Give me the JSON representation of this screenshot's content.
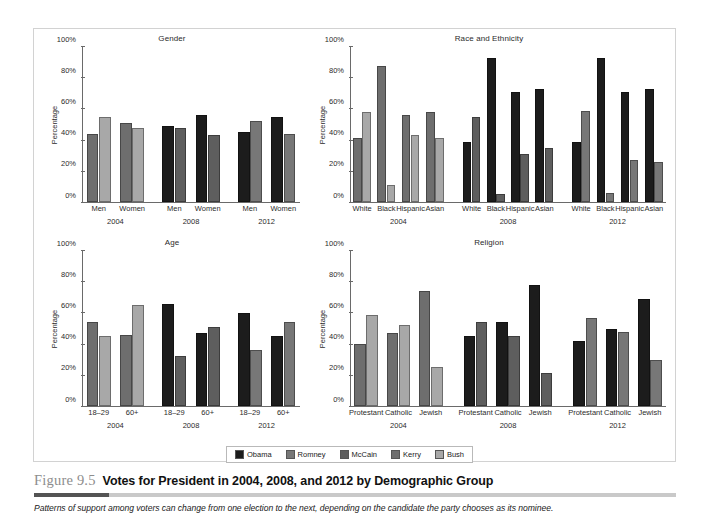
{
  "figure": {
    "number": "Figure 9.5",
    "title": "Votes for President in 2004, 2008, and 2012 by Demographic Group",
    "subtitle": "Patterns of support among voters can change from one election to the next, depending on the candidate the party chooses as its nominee."
  },
  "legend": {
    "position": "bottom-center",
    "items": [
      {
        "label": "Obama",
        "color": "#1c1c1c"
      },
      {
        "label": "Romney",
        "color": "#777777"
      },
      {
        "label": "McCain",
        "color": "#5e5e5e"
      },
      {
        "label": "Kerry",
        "color": "#6e6e6e"
      },
      {
        "label": "Bush",
        "color": "#a8a8a8"
      }
    ]
  },
  "axis": {
    "ylabel": "Percentage",
    "ticks": [
      "0%",
      "20%",
      "40%",
      "60%",
      "80%",
      "100%"
    ],
    "ylim": [
      0,
      100
    ]
  },
  "chart_data": [
    {
      "type": "bar",
      "title": "Gender",
      "xlabel": "",
      "ylabel": "Percentage",
      "ylim": [
        0,
        100
      ],
      "grid": false,
      "years": [
        "2004",
        "2008",
        "2012"
      ],
      "categories": [
        "Men",
        "Women",
        "Men",
        "Women",
        "Men",
        "Women"
      ],
      "series": [
        {
          "name": "Kerry",
          "color": "#6e6e6e",
          "values": [
            44,
            51,
            null,
            null,
            null,
            null
          ]
        },
        {
          "name": "Bush",
          "color": "#a8a8a8",
          "values": [
            55,
            48,
            null,
            null,
            null,
            null
          ]
        },
        {
          "name": "Obama",
          "color": "#1c1c1c",
          "values": [
            null,
            null,
            49,
            56,
            45,
            55
          ]
        },
        {
          "name": "McCain",
          "color": "#5e5e5e",
          "values": [
            null,
            null,
            48,
            43,
            null,
            null
          ]
        },
        {
          "name": "Romney",
          "color": "#777777",
          "values": [
            null,
            null,
            null,
            null,
            52,
            44
          ]
        }
      ]
    },
    {
      "type": "bar",
      "title": "Race and Ethnicity",
      "xlabel": "",
      "ylabel": "Percentage",
      "ylim": [
        0,
        100
      ],
      "grid": false,
      "years": [
        "2004",
        "2008",
        "2012"
      ],
      "categories": [
        "White",
        "Black",
        "Hispanic",
        "Asian",
        "White",
        "Black",
        "Hispanic",
        "Asian",
        "White",
        "Black",
        "Hispanic",
        "Asian"
      ],
      "series": [
        {
          "name": "Kerry",
          "color": "#6e6e6e",
          "values": [
            41,
            88,
            56,
            58,
            null,
            null,
            null,
            null,
            null,
            null,
            null,
            null
          ]
        },
        {
          "name": "Bush",
          "color": "#a8a8a8",
          "values": [
            58,
            11,
            43,
            41,
            null,
            null,
            null,
            null,
            null,
            null,
            null,
            null
          ]
        },
        {
          "name": "Obama",
          "color": "#1c1c1c",
          "values": [
            null,
            null,
            null,
            null,
            39,
            93,
            71,
            73,
            39,
            93,
            71,
            73
          ]
        },
        {
          "name": "McCain",
          "color": "#5e5e5e",
          "values": [
            null,
            null,
            null,
            null,
            55,
            5,
            31,
            35,
            null,
            null,
            null,
            null
          ]
        },
        {
          "name": "Romney",
          "color": "#777777",
          "values": [
            null,
            null,
            null,
            null,
            null,
            null,
            null,
            null,
            59,
            6,
            27,
            26
          ]
        }
      ]
    },
    {
      "type": "bar",
      "title": "Age",
      "xlabel": "",
      "ylabel": "Percentage",
      "ylim": [
        0,
        100
      ],
      "grid": false,
      "years": [
        "2004",
        "2008",
        "2012"
      ],
      "categories": [
        "18–29",
        "60+",
        "18–29",
        "60+",
        "18–29",
        "60+"
      ],
      "series": [
        {
          "name": "Kerry",
          "color": "#6e6e6e",
          "values": [
            54,
            46,
            null,
            null,
            null,
            null
          ]
        },
        {
          "name": "Bush",
          "color": "#a8a8a8",
          "values": [
            45,
            65,
            null,
            null,
            null,
            null
          ]
        },
        {
          "name": "Obama",
          "color": "#1c1c1c",
          "values": [
            null,
            null,
            66,
            47,
            60,
            45
          ]
        },
        {
          "name": "McCain",
          "color": "#5e5e5e",
          "values": [
            null,
            null,
            32,
            51,
            null,
            null
          ]
        },
        {
          "name": "Romney",
          "color": "#777777",
          "values": [
            null,
            null,
            null,
            null,
            36,
            54
          ]
        }
      ]
    },
    {
      "type": "bar",
      "title": "Religion",
      "xlabel": "",
      "ylabel": "Percentage",
      "ylim": [
        0,
        100
      ],
      "grid": false,
      "years": [
        "2004",
        "2008",
        "2012"
      ],
      "categories": [
        "Protestant",
        "Catholic",
        "Jewish",
        "Protestant",
        "Catholic",
        "Jewish",
        "Protestant",
        "Catholic",
        "Jewish"
      ],
      "series": [
        {
          "name": "Kerry",
          "color": "#6e6e6e",
          "values": [
            40,
            47,
            74,
            null,
            null,
            null,
            null,
            null,
            null
          ]
        },
        {
          "name": "Bush",
          "color": "#a8a8a8",
          "values": [
            59,
            52,
            25,
            null,
            null,
            null,
            null,
            null,
            null
          ]
        },
        {
          "name": "Obama",
          "color": "#1c1c1c",
          "values": [
            null,
            null,
            null,
            45,
            54,
            78,
            42,
            50,
            69
          ]
        },
        {
          "name": "McCain",
          "color": "#5e5e5e",
          "values": [
            null,
            null,
            null,
            54,
            45,
            21,
            null,
            null,
            null
          ]
        },
        {
          "name": "Romney",
          "color": "#777777",
          "values": [
            null,
            null,
            null,
            null,
            null,
            null,
            57,
            48,
            30
          ]
        }
      ]
    }
  ]
}
